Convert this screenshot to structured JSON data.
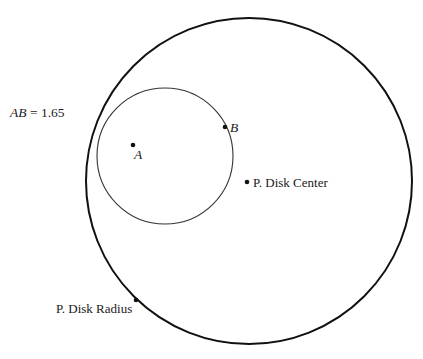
{
  "measurement": {
    "label_var": "AB",
    "equals": " = ",
    "value": "1.65"
  },
  "points": {
    "A": {
      "label": "A"
    },
    "B": {
      "label": "B"
    },
    "disk_center": {
      "label": "P. Disk Center"
    },
    "disk_radius": {
      "label": "P. Disk Radius"
    }
  },
  "colors": {
    "outer_stroke": "#111111",
    "inner_stroke": "#333333",
    "point": "#111111"
  }
}
